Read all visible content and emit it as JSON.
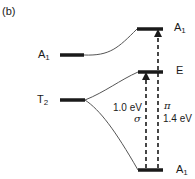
{
  "panel_label": "(b)",
  "levels": {
    "left_a1": {
      "symbol": "A",
      "subscript": "1"
    },
    "left_t2": {
      "symbol": "T",
      "subscript": "2"
    },
    "right_a1_top": {
      "symbol": "A",
      "subscript": "1"
    },
    "right_e": {
      "symbol": "E",
      "subscript": ""
    },
    "right_a1_bottom": {
      "symbol": "A",
      "subscript": "1"
    }
  },
  "transitions": {
    "sigma": {
      "energy": "1.0 eV",
      "symbol": "σ"
    },
    "pi": {
      "energy": "1.4 eV",
      "symbol": "π"
    }
  },
  "colors": {
    "ink": "#1a1a1a",
    "connector": "#555555"
  }
}
